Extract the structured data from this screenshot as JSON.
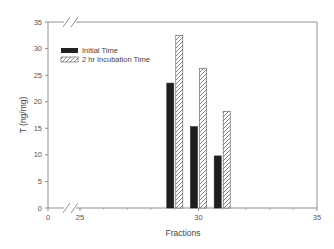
{
  "chart_data": {
    "type": "bar",
    "title": "",
    "xlabel": "Fractions",
    "ylabel": "T (ng/mg)",
    "xlim": [
      0,
      35
    ],
    "ylim": [
      0,
      35
    ],
    "x_axis_break": "between 0 and 25",
    "xticks": [
      0,
      25,
      30,
      35
    ],
    "yticks": [
      0,
      5,
      10,
      15,
      20,
      25,
      30,
      35
    ],
    "grid": false,
    "legend_position": "upper-left inside plot",
    "categories": [
      29,
      30,
      31
    ],
    "series": [
      {
        "name": "Initial Time",
        "fill": "solid-black",
        "values": [
          23.5,
          15.3,
          9.8
        ]
      },
      {
        "name": "2 hr Incubation Time",
        "fill": "diagonal-hatch",
        "values": [
          32.5,
          26.3,
          18.2
        ]
      }
    ]
  },
  "labels": {
    "xlabel": "Fractions",
    "ylabel": "T (ng/mg)",
    "legend": [
      "Initial Time",
      "2 hr Incubation Time"
    ],
    "xticks": [
      "0",
      "25",
      "30",
      "35"
    ],
    "yticks": [
      "0",
      "5",
      "10",
      "15",
      "20",
      "25",
      "30",
      "35"
    ]
  }
}
